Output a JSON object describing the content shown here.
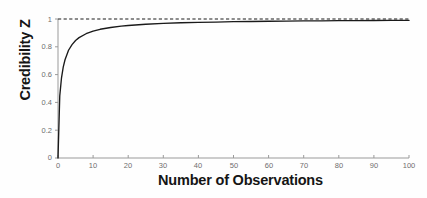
{
  "chart_data": {
    "type": "line",
    "title": "",
    "xlabel": "Number of Observations",
    "ylabel": "Credibility Z",
    "xlim": [
      0,
      100
    ],
    "ylim": [
      0,
      1
    ],
    "xticks": [
      "0",
      "10",
      "20",
      "30",
      "40",
      "50",
      "60",
      "70",
      "80",
      "90",
      "100"
    ],
    "xtick_values": [
      0,
      10,
      20,
      30,
      40,
      50,
      60,
      70,
      80,
      90,
      100
    ],
    "yticks": [
      "0",
      "0.2",
      "0.4",
      "0.6",
      "0.8",
      "1"
    ],
    "ytick_values": [
      0,
      0.2,
      0.4,
      0.6,
      0.8,
      1
    ],
    "grid": false,
    "legend": "none",
    "series": [
      {
        "name": "Credibility Z",
        "style": "solid",
        "color": "#1a1a1a",
        "x": [
          0,
          0.5,
          1,
          1.5,
          2,
          3,
          4,
          5,
          6,
          8,
          10,
          12,
          15,
          18,
          20,
          25,
          30,
          35,
          40,
          45,
          50,
          55,
          60,
          65,
          70,
          75,
          80,
          85,
          90,
          95,
          100
        ],
        "values": [
          0.0,
          0.447,
          0.577,
          0.655,
          0.707,
          0.775,
          0.816,
          0.845,
          0.866,
          0.894,
          0.913,
          0.926,
          0.939,
          0.949,
          0.953,
          0.962,
          0.968,
          0.973,
          0.976,
          0.978,
          0.981,
          0.982,
          0.984,
          0.985,
          0.986,
          0.987,
          0.988,
          0.988,
          0.989,
          0.99,
          0.99
        ]
      },
      {
        "name": "Full credibility reference",
        "style": "dashed",
        "color": "#1a1a1a",
        "x": [
          0,
          100
        ],
        "values": [
          1.0,
          1.0
        ]
      }
    ],
    "annotations": []
  },
  "axes": {
    "axis_color": "#9a9a9a",
    "tick_label_color": "#6e6e6e",
    "title_color": "#151515"
  }
}
